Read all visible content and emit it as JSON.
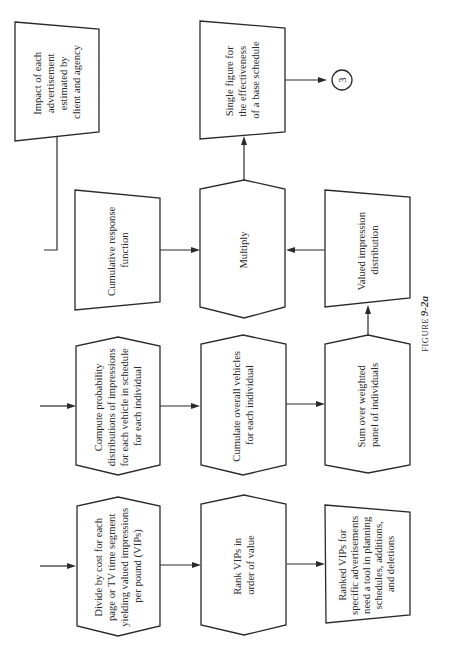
{
  "figure": {
    "caption_prefix": "FIGURE",
    "caption_number": "9-2a"
  },
  "nodes": {
    "impact": {
      "shape": "manual-input",
      "lines": [
        "Impact of each",
        "advertisement",
        "estimated by",
        "client and agency"
      ]
    },
    "single_figure": {
      "shape": "manual-input",
      "lines": [
        "Single figure for",
        "the effectiveness",
        "of a base schedule"
      ]
    },
    "connector": {
      "shape": "circle",
      "label": "3"
    },
    "cumulative_response": {
      "shape": "manual-input",
      "lines": [
        "Cumulative response",
        "function"
      ]
    },
    "multiply": {
      "shape": "hexagon",
      "lines": [
        "Multiply"
      ]
    },
    "valued_impression": {
      "shape": "manual-input",
      "lines": [
        "Valued impression",
        "distribution"
      ]
    },
    "compute_probability": {
      "shape": "hexagon",
      "lines": [
        "Compute probability",
        "distributions of impressions",
        "for each vehicle in schedule",
        "for each individual"
      ]
    },
    "cumulate_vehicles": {
      "shape": "hexagon",
      "lines": [
        "Cumulate overall vehicles",
        "for each individual"
      ]
    },
    "sum_weighted": {
      "shape": "hexagon",
      "lines": [
        "Sum over weighted",
        "panel of individuals"
      ]
    },
    "divide_cost": {
      "shape": "hexagon",
      "lines": [
        "Divide by cost for each",
        "page or TV time segment",
        "yielding valued impressions",
        "per pound (VIPs)"
      ]
    },
    "rank_vips": {
      "shape": "hexagon",
      "lines": [
        "Rank VIPs in",
        "order of value"
      ]
    },
    "ranked_vips": {
      "shape": "manual-input",
      "lines": [
        "Ranked VIPs for",
        "specific advertisements",
        "need a tool in planning",
        "schedules, additions,",
        "and deletions"
      ]
    }
  },
  "edges": [
    {
      "from": "impact",
      "to": "cumulative_response"
    },
    {
      "from": "cumulative_response",
      "to": "multiply"
    },
    {
      "from": "valued_impression",
      "to": "multiply"
    },
    {
      "from": "multiply",
      "to": "single_figure"
    },
    {
      "from": "single_figure",
      "to": "connector"
    },
    {
      "from": "input",
      "to": "compute_probability"
    },
    {
      "from": "compute_probability",
      "to": "cumulate_vehicles"
    },
    {
      "from": "cumulate_vehicles",
      "to": "sum_weighted"
    },
    {
      "from": "sum_weighted",
      "to": "valued_impression"
    },
    {
      "from": "input",
      "to": "divide_cost"
    },
    {
      "from": "divide_cost",
      "to": "rank_vips"
    },
    {
      "from": "rank_vips",
      "to": "ranked_vips"
    }
  ]
}
